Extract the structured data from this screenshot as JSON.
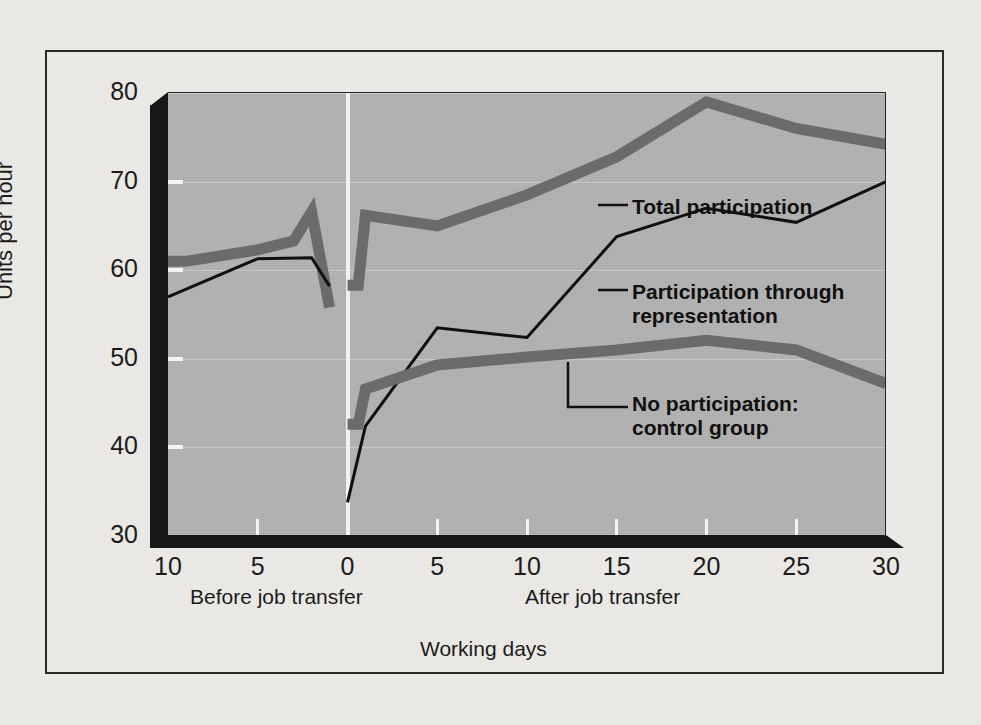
{
  "figure": {
    "axis_title_y": "Units per hour",
    "axis_title_x": "Working days",
    "caption_before": "Before job transfer",
    "caption_after": "After job transfer"
  },
  "colors": {
    "paper": "#edebe7",
    "frame": "#2a2a2a",
    "plot_bg": "#b2b2b2",
    "slab_dark": "#171717",
    "thick_line": "#6b6b6b",
    "thin_line": "#101010",
    "divider": "#f2f2f2",
    "tick": "#f4f4f4"
  },
  "annotations": [
    {
      "name": "total-participation",
      "text": "Total participation"
    },
    {
      "name": "participation-through-representation",
      "text": "Participation through\nrepresentation"
    },
    {
      "name": "no-participation-control-group",
      "text": "No participation:\ncontrol group"
    }
  ],
  "chart_data": {
    "type": "line",
    "title": "",
    "xlabel": "Working days",
    "ylabel": "Units per hour",
    "xlim": [
      -10,
      30
    ],
    "ylim": [
      30,
      80
    ],
    "grid": true,
    "legend_position": "inline-annotations",
    "xtick_positions": [
      -10,
      -5,
      0,
      5,
      10,
      15,
      20,
      25,
      30
    ],
    "xtick_labels": [
      "10",
      "5",
      "0",
      "5",
      "10",
      "15",
      "20",
      "25",
      "30"
    ],
    "ytick_values": [
      30,
      40,
      50,
      60,
      70,
      80
    ],
    "ytick_labels": [
      "30",
      "40",
      "50",
      "60",
      "70",
      "80"
    ],
    "divider_x": 0,
    "segments": [
      {
        "name": "Total participation",
        "style": "thick-gray",
        "color": "#6b6b6b",
        "width_px": 11,
        "before": {
          "x": [
            -10,
            -9,
            -5,
            -3,
            -2,
            -1
          ],
          "y": [
            61.0,
            61.0,
            62.3,
            63.3,
            66.6,
            55.8
          ]
        },
        "after": {
          "x": [
            0,
            0.6,
            1,
            5,
            10,
            15,
            20,
            25,
            30
          ],
          "y": [
            58.3,
            58.3,
            66.2,
            65.0,
            68.5,
            72.8,
            79.0,
            76.0,
            74.2
          ]
        }
      },
      {
        "name": "Participation through representation",
        "style": "thin-black",
        "color": "#101010",
        "width_px": 3,
        "before": {
          "x": [
            -10,
            -5,
            -2,
            -1
          ],
          "y": [
            57.0,
            61.3,
            61.4,
            58.2
          ]
        },
        "after": {
          "x": [
            0,
            1,
            5,
            10,
            15,
            20,
            25,
            30
          ],
          "y": [
            33.8,
            42.4,
            53.5,
            52.4,
            63.8,
            67.0,
            65.4,
            70.0
          ]
        }
      },
      {
        "name": "No participation: control group",
        "style": "thick-gray",
        "color": "#6b6b6b",
        "width_px": 11,
        "before": null,
        "after": {
          "x": [
            0,
            0.6,
            1,
            5,
            10,
            15,
            20,
            25,
            30
          ],
          "y": [
            42.6,
            42.6,
            46.6,
            49.3,
            50.2,
            51.0,
            52.1,
            51.0,
            47.2
          ]
        }
      }
    ]
  }
}
